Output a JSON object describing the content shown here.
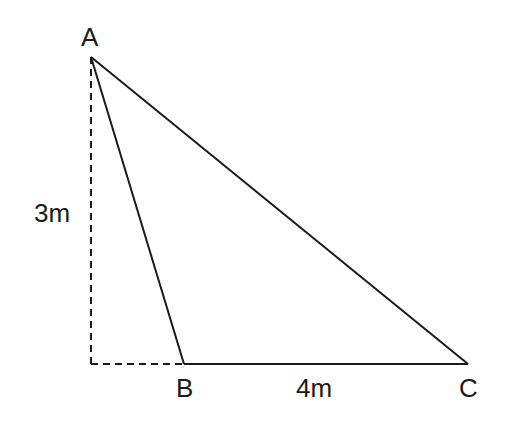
{
  "diagram": {
    "type": "right-triangle-geometry",
    "colors": {
      "stroke": "#1a1a1a",
      "background": "#ffffff"
    },
    "vertices": {
      "A": {
        "label": "A",
        "x": 91,
        "y": 57
      },
      "B": {
        "label": "B",
        "x": 184,
        "y": 364
      },
      "C": {
        "label": "C",
        "x": 468,
        "y": 364
      },
      "foot": {
        "x": 91,
        "y": 364
      }
    },
    "labels": {
      "A": "A",
      "B": "B",
      "C": "C",
      "height": "3m",
      "base": "4m"
    },
    "measurements": {
      "height_AB_perpendicular": "3m",
      "base_BC": "4m"
    },
    "edges": [
      {
        "from": "A",
        "to": "B",
        "style": "solid"
      },
      {
        "from": "B",
        "to": "C",
        "style": "solid"
      },
      {
        "from": "A",
        "to": "C",
        "style": "solid"
      },
      {
        "from": "A",
        "to": "foot",
        "style": "dashed"
      },
      {
        "from": "foot",
        "to": "B",
        "style": "dashed"
      }
    ]
  }
}
